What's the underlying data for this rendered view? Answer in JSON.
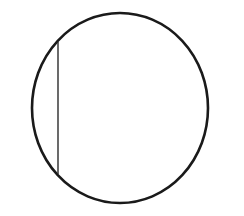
{
  "canvas": {
    "width": 244,
    "height": 216,
    "background_color": "#FFFFFF",
    "title": "Circle with vertical chord"
  },
  "figure": {
    "type": "geometry-diagram",
    "stroke_color": "#1A1A1A",
    "fill_color": "none"
  },
  "shapes": [
    {
      "name": "circle-outline",
      "kind": "circle",
      "center_x": 120,
      "center_y": 108,
      "radius_x": 88,
      "radius_y": 95,
      "stroke_color": "#1A1A1A",
      "stroke_width": 2.6,
      "fill": "none"
    },
    {
      "name": "vertical-chord",
      "kind": "line",
      "x1": 58,
      "y1": 42,
      "x2": 58,
      "y2": 174,
      "stroke_color": "#2B2B2B",
      "stroke_width": 1.4,
      "fill": "none"
    }
  ],
  "chart_data": {
    "type": "scatter",
    "xlabel": "",
    "ylabel": "",
    "xlim": [
      0,
      244
    ],
    "ylim": [
      0,
      216
    ],
    "grid": false,
    "legend": "none",
    "annotations": [],
    "series": [
      {
        "name": "circle-outline",
        "geometry": "ellipse",
        "center": [
          120,
          108
        ],
        "radii": [
          88,
          95
        ],
        "values": []
      },
      {
        "name": "vertical-chord",
        "geometry": "segment",
        "x": [
          58,
          58
        ],
        "values": [
          42,
          174
        ]
      }
    ]
  }
}
